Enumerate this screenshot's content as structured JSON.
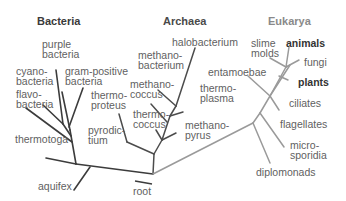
{
  "diagram": {
    "type": "phylogenetic-tree",
    "root_label": "root",
    "domains": [
      {
        "name": "Bacteria",
        "color": "#3a3a3a"
      },
      {
        "name": "Archaea",
        "color": "#4a4a4a"
      },
      {
        "name": "Eukarya",
        "color": "#8a8a8a"
      }
    ],
    "bacteria": {
      "purple_bacteria": "purple\nbacteria",
      "cyanobacteria": "cyano-\nbacteria",
      "gram_positive": "gram-positive\nbacteria",
      "flavobacteria": "flavo-\nbacteria",
      "thermotoga": "thermotoga",
      "aquifex": "aquifex"
    },
    "archaea": {
      "halobacterium": "halobacterium",
      "methanobacterium": "methano-\nbacterium",
      "methanococcus": "methano-\ncoccus",
      "thermoproteus": "thermo-\nproteus",
      "thermoplasma": "thermo-\nplasma",
      "thermococcus": "thermo-\ncoccus",
      "pyrodictium": "pyrodic-\ntium",
      "methanopyrus": "methano-\npyrus"
    },
    "eukarya": {
      "slime_molds": "slime\nmolds",
      "animals": "animals",
      "entamoebae": "entamoebae",
      "fungi": "fungi",
      "plants": "plants",
      "ciliates": "ciliates",
      "flagellates": "flagellates",
      "microsporidia": "micro-\nsporidia",
      "diplomonads": "diplomonads"
    }
  }
}
